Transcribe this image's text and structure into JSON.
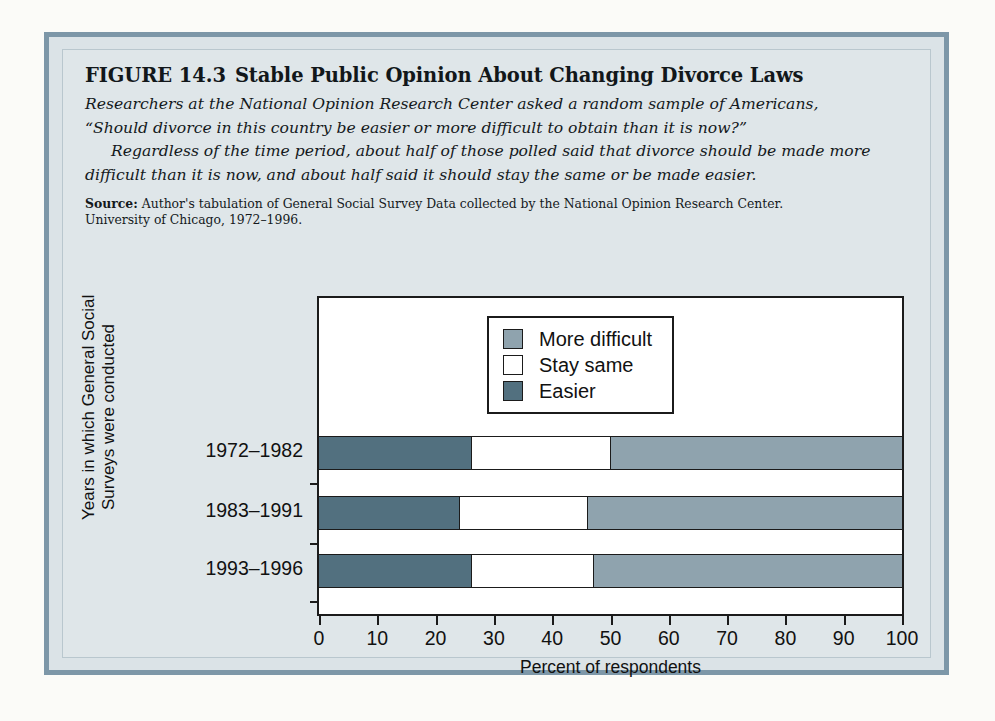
{
  "figure": {
    "label": "FIGURE 14.3",
    "title": "Stable Public Opinion About Changing Divorce Laws",
    "lead_line1": "Researchers at the National Opinion Research Center asked a random sample of Americans,",
    "lead_line2": "“Should divorce in this country be easier or more difficult to obtain than it is now?”",
    "lead_line3": "Regardless of the time period, about half of those polled said that divorce should be made more",
    "lead_line4": "difficult than it is now, and about half said it should stay the same or be made easier.",
    "source_label": "Source:",
    "source_line1": "Author's tabulation of General Social Survey Data collected by the National Opinion Research Center.",
    "source_line2": "University of Chicago, 1972–1996."
  },
  "chart_data": {
    "type": "bar",
    "orientation": "horizontal",
    "stacked": true,
    "title": "Stable Public Opinion About Changing Divorce Laws",
    "xlabel": "Percent of respondents",
    "ylabel_line1": "Years in which General Social",
    "ylabel_line2": "Surveys were conducted",
    "xlim": [
      0,
      100
    ],
    "xticks": [
      0,
      10,
      20,
      30,
      40,
      50,
      60,
      70,
      80,
      90,
      100
    ],
    "xtick_labels": [
      "0",
      "10",
      "20",
      "30",
      "40",
      "50",
      "60",
      "70",
      "80",
      "90",
      "100"
    ],
    "grid": false,
    "legend_position": "inside-top-center",
    "categories": [
      "1972–1982",
      "1983–1991",
      "1993–1996"
    ],
    "series": [
      {
        "name": "Easier",
        "color": "#52707f",
        "values": [
          26,
          24,
          26
        ]
      },
      {
        "name": "Stay same",
        "color": "#ffffff",
        "values": [
          24,
          22,
          21
        ]
      },
      {
        "name": "More difficult",
        "color": "#8fa3ae",
        "values": [
          50,
          54,
          53
        ]
      }
    ],
    "legend_order": [
      "More difficult",
      "Stay same",
      "Easier"
    ],
    "annotations": []
  },
  "colors": {
    "more_difficult": "#8fa3ae",
    "stay_same": "#ffffff",
    "easier": "#52707f",
    "frame": "#7d97a8",
    "page_background": "#dfe6e9",
    "ink": "#1b1b1b"
  }
}
